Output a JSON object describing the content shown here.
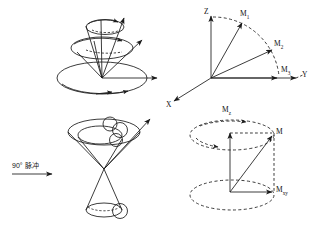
{
  "figure": {
    "stroke_color": "#1a1a1a",
    "background": "#ffffff"
  },
  "annotation": {
    "pulse_label": "90° 脉冲",
    "pulse_degrees": "90",
    "pulse_unit": "°",
    "pulse_text": "脉冲"
  },
  "axes": {
    "z": "Z",
    "y": "Y",
    "x": "X"
  },
  "vectors": {
    "m1": "M",
    "m1_sub": "1",
    "m2": "M",
    "m2_sub": "2",
    "m3": "M",
    "m3_sub": "3",
    "m": "M",
    "m_sub": "",
    "mz": "M",
    "mz_sub": "z",
    "mxy": "M",
    "mxy_sub": "xy"
  },
  "panels": {
    "top_left": "nested-precession-cones",
    "top_right": "coordinate-axes-vectors",
    "bottom_left": "double-cone-spins",
    "bottom_right": "magnetization-components"
  }
}
